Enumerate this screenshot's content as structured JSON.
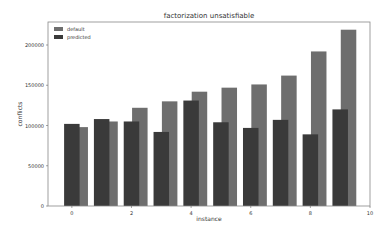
{
  "chart_data": {
    "type": "bar",
    "title": "factorization unsatisfiable",
    "xlabel": "instance",
    "ylabel": "conflicts",
    "categories": [
      0,
      1,
      2,
      3,
      4,
      5,
      6,
      7,
      8,
      9
    ],
    "series": [
      {
        "name": "default",
        "color": "#6e6e6e",
        "values": [
          98000,
          105000,
          122000,
          130000,
          142000,
          147000,
          151000,
          162000,
          192000,
          219000
        ]
      },
      {
        "name": "predicted",
        "color": "#3a3a3a",
        "values": [
          102000,
          108000,
          105000,
          92000,
          131000,
          104000,
          97000,
          107000,
          89000,
          120000
        ]
      }
    ],
    "xticks": [
      0,
      2,
      4,
      6,
      8,
      10
    ],
    "yticks": [
      0,
      50000,
      100000,
      150000,
      200000
    ],
    "ylim": [
      0,
      230000
    ],
    "xlim": [
      -0.8,
      10
    ],
    "legend_position": "upper left",
    "grid": false
  }
}
